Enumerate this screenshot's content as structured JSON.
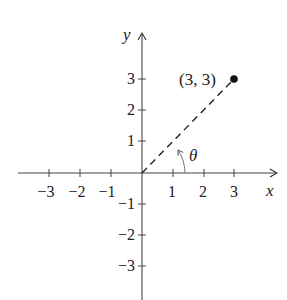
{
  "diagram": {
    "type": "coordinate-plane",
    "axes": {
      "x_label": "x",
      "y_label": "y",
      "x_ticks": [
        {
          "value": -3,
          "label": "−3"
        },
        {
          "value": -2,
          "label": "−2"
        },
        {
          "value": -1,
          "label": "−1"
        },
        {
          "value": 1,
          "label": "1"
        },
        {
          "value": 2,
          "label": "2"
        },
        {
          "value": 3,
          "label": "3"
        }
      ],
      "y_ticks": [
        {
          "value": 3,
          "label": "3"
        },
        {
          "value": 2,
          "label": "2"
        },
        {
          "value": 1,
          "label": "1"
        },
        {
          "value": -1,
          "label": "−1"
        },
        {
          "value": -2,
          "label": "−2"
        },
        {
          "value": -3,
          "label": "−3"
        }
      ]
    },
    "point": {
      "x": 3,
      "y": 3,
      "label": "(3, 3)"
    },
    "segment": {
      "from": [
        0,
        0
      ],
      "to": [
        3,
        3
      ],
      "style": "dashed"
    },
    "angle": {
      "label": "θ",
      "description": "angle from positive x-axis to segment"
    },
    "colors": {
      "ink": "#222222",
      "background": "#ffffff"
    }
  }
}
